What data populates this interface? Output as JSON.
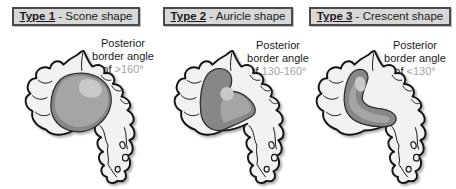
{
  "panels": [
    {
      "header": {
        "type": "Type 1",
        "rest": " - Scone shape"
      },
      "annotation": {
        "line1": "Posterior",
        "line2": "border angle",
        "line3_prefix": "of ",
        "value": ">160°"
      },
      "illustration": "anatomy-drawing-scone-region"
    },
    {
      "header": {
        "type": "Type 2",
        "rest": " - Auricle shape"
      },
      "annotation": {
        "line1": "Posterior",
        "line2": "border angle",
        "line3_prefix": "of ",
        "value": "130-160°"
      },
      "illustration": "anatomy-drawing-auricle-region"
    },
    {
      "header": {
        "type": "Type 3",
        "rest": " - Crescent shape"
      },
      "annotation": {
        "line1": "Posterior",
        "line2": "border angle",
        "line3_prefix": "of ",
        "value": "<130°"
      },
      "illustration": "anatomy-drawing-crescent-region"
    }
  ],
  "colors": {
    "background": "#ffffff",
    "header_box_bg": "#d8d8d8",
    "header_box_border": "#4a4a4a",
    "text": "#1a1a1a",
    "angle_value": "#a2a2a2",
    "cartilage_fill": "#f2f2f2",
    "cartilage_stroke": "#141414",
    "region_dark": "#878787",
    "region_mid": "#a5a5a5",
    "region_highlight": "#c9c9c9"
  }
}
